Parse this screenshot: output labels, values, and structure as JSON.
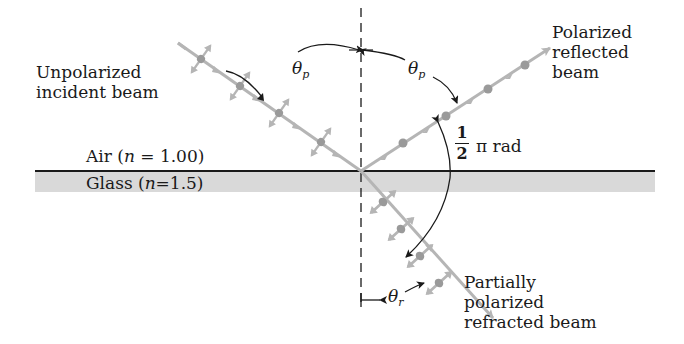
{
  "diagram": {
    "media": {
      "air_label_prefix": "Air (",
      "air_label_var": "n",
      "air_label_suffix": " = 1.00)",
      "glass_label_prefix": "Glass  (",
      "glass_label_var": "n",
      "glass_label_suffix": "=1.5)"
    },
    "beams": {
      "incident": {
        "line1": "Unpolarized",
        "line2": "incident beam"
      },
      "reflected": {
        "line1": "Polarized",
        "line2": "reflected",
        "line3": "beam"
      },
      "refracted": {
        "line1": "Partially",
        "line2": "polarized",
        "line3": "refracted beam"
      }
    },
    "angles": {
      "theta_p_symbol": "θ",
      "theta_p_sub": "p",
      "theta_r_symbol": "θ",
      "theta_r_sub": "r",
      "right_angle_num": "1",
      "right_angle_den": "2",
      "right_angle_suffix": "π rad"
    },
    "colors": {
      "glass": "#d9d9d9",
      "beam": "#b5b5b5",
      "beam_node": "#9a9a9a",
      "ink": "#1a1a1a"
    }
  }
}
